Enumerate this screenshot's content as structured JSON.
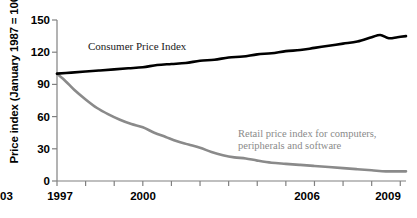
{
  "chart_data": {
    "type": "line",
    "title": "",
    "xlabel": "",
    "ylabel": "Price index (January 1987 = 100)",
    "xlim": [
      1997,
      2009.2
    ],
    "ylim": [
      0,
      150
    ],
    "yticks": [
      0,
      30,
      60,
      90,
      120,
      150
    ],
    "xticks": [
      1997,
      1998,
      1999,
      2000,
      2001,
      2002,
      2003,
      2004,
      2005,
      2006,
      2007,
      2008,
      2009
    ],
    "xtick_labels": [
      "1997",
      "",
      "",
      "2000",
      "",
      "",
      "2003",
      "",
      "",
      "2006",
      "",
      "",
      "2009"
    ],
    "grid": false,
    "legend_position": "inline-annotation",
    "series": [
      {
        "name": "Consumer Price Index",
        "color": "#000000",
        "x": [
          1997.0,
          1997.5,
          1998.0,
          1998.5,
          1999.0,
          1999.5,
          2000.0,
          2000.5,
          2001.0,
          2001.5,
          2002.0,
          2002.5,
          2003.0,
          2003.5,
          2004.0,
          2004.5,
          2005.0,
          2005.5,
          2006.0,
          2006.5,
          2007.0,
          2007.5,
          2008.0,
          2008.3,
          2008.6,
          2008.9,
          2009.2
        ],
        "values": [
          100,
          101,
          102,
          103,
          104,
          105,
          106,
          108,
          109,
          110,
          112,
          113,
          115,
          116,
          118,
          119,
          121,
          122,
          124,
          126,
          128,
          130,
          134,
          136,
          133,
          134,
          135
        ]
      },
      {
        "name": "Retail price index for computers, peripherals and software",
        "color": "#8a8a8a",
        "x": [
          1997.0,
          1997.3,
          1997.6,
          1998.0,
          1998.4,
          1998.8,
          1999.2,
          1999.6,
          2000.0,
          2000.4,
          2000.8,
          2001.2,
          2001.6,
          2002.0,
          2002.4,
          2002.8,
          2003.2,
          2003.6,
          2004.0,
          2004.5,
          2005.0,
          2005.5,
          2006.0,
          2006.5,
          2007.0,
          2007.5,
          2008.0,
          2008.5,
          2009.0,
          2009.2
        ],
        "values": [
          100,
          93,
          85,
          76,
          68,
          62,
          57,
          53,
          50,
          45,
          41,
          37,
          34,
          31,
          27,
          24,
          22,
          21,
          19,
          17,
          16,
          15,
          14,
          13,
          12,
          11,
          10,
          9,
          9,
          9
        ]
      }
    ],
    "annotations": [
      {
        "text": "Consumer Price Index",
        "series": "Consumer Price Index"
      },
      {
        "line1": "Retail price index for computers,",
        "line2": "peripherals and software",
        "series": "Retail price index for computers, peripherals and software"
      }
    ]
  },
  "axis": {
    "y_title": "Price index (January 1987 = 100)",
    "y_tick_labels": [
      "150",
      "120",
      "90",
      "60",
      "30",
      "0"
    ],
    "x_tick_labels": [
      "1997",
      "2000",
      "2003",
      "2006",
      "2009"
    ]
  },
  "labels": {
    "cpi": "Consumer Price Index",
    "retail_line1": "Retail price index for computers,",
    "retail_line2": "peripherals and software"
  },
  "colors": {
    "cpi_line": "#000000",
    "retail_line": "#8a8a8a",
    "axis": "#777777",
    "background": "#ffffff"
  }
}
